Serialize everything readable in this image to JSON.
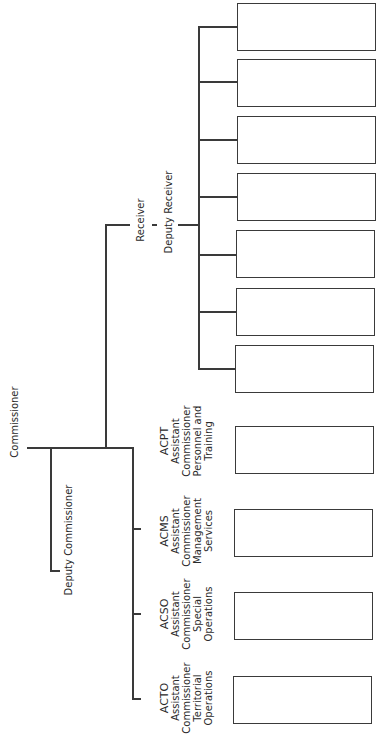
{
  "chart": {
    "orientation": "rotated-90-ccw",
    "root": {
      "label": "Commissioner"
    },
    "deputy": {
      "label": "Deputy Commissioner"
    },
    "receiver": {
      "label_top": "Receiver",
      "label_bottom": "Deputy Receiver",
      "child_box_count": 7
    },
    "assistants": [
      {
        "abbr": "ACPT",
        "line1": "Assistant",
        "line2": "Commissioner",
        "line3": "Personnel and",
        "line4": "Training"
      },
      {
        "abbr": "ACMS",
        "line1": "Assistant",
        "line2": "Commissioner",
        "line3": "Management",
        "line4": "Services"
      },
      {
        "abbr": "ACSO",
        "line1": "Assistant",
        "line2": "Commissioner",
        "line3": "Special",
        "line4": "Operations"
      },
      {
        "abbr": "ACTO",
        "line1": "Assistant",
        "line2": "Commissioner",
        "line3": "Territorial",
        "line4": "Operations"
      }
    ]
  }
}
